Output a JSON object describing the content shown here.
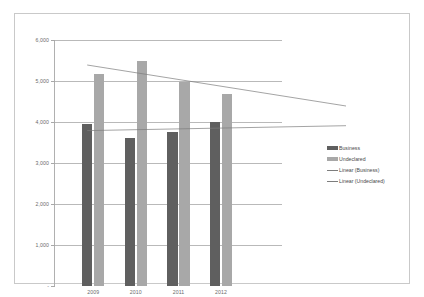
{
  "chart_data": {
    "type": "bar",
    "title": "",
    "subtitle": "",
    "xlabel": "",
    "ylabel": "",
    "categories": [
      "2009",
      "2010",
      "2011",
      "2012"
    ],
    "series": [
      {
        "name": "Business",
        "values": [
          3960,
          3620,
          3760,
          3990
        ],
        "color": "#5f5f5f"
      },
      {
        "name": "Undeclared",
        "values": [
          5180,
          5480,
          4980,
          4690
        ],
        "color": "#a8a8a8"
      }
    ],
    "trendlines": [
      {
        "name": "Linear (Business)",
        "start": 3790,
        "end": 3910,
        "color": "#7d7d7d"
      },
      {
        "name": "Linear (Undeclared)",
        "start": 5390,
        "end": 4390,
        "color": "#7d7d7d"
      }
    ],
    "ylim": [
      0,
      6000
    ],
    "yticks": [
      "-",
      "1,000",
      "2,000",
      "3,000",
      "4,000",
      "5,000",
      "6,000"
    ],
    "ytick_values": [
      0,
      1000,
      2000,
      3000,
      4000,
      5000,
      6000
    ],
    "grid": true,
    "legend_position": "right",
    "legend": [
      "Business",
      "Undeclared",
      "Linear (Business)",
      "Linear (Undeclared)"
    ]
  },
  "legend": {
    "items": [
      {
        "label": "Business",
        "marker": "swatch-dark"
      },
      {
        "label": "Undeclared",
        "marker": "swatch-light"
      },
      {
        "label": "Linear (Business)",
        "marker": "line"
      },
      {
        "label": "Linear (Undeclared)",
        "marker": "line"
      }
    ]
  },
  "colors": {
    "business": "#5f5f5f",
    "undeclared": "#a8a8a8",
    "trendline": "#7d7d7d",
    "gridline": "#b9b9b9",
    "frame": "#c9c9c9",
    "text": "#6b6b6b"
  }
}
